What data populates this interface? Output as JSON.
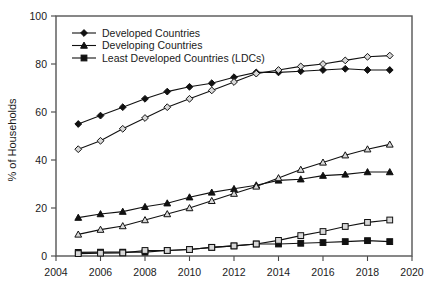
{
  "chart_data": {
    "type": "line",
    "title": "",
    "xlabel": "",
    "ylabel": "% of Households",
    "xlim": [
      2004,
      2020
    ],
    "ylim": [
      0,
      100
    ],
    "xticks": [
      "2004",
      "2006",
      "2008",
      "2010",
      "2012",
      "2014",
      "2016",
      "2018",
      "2020"
    ],
    "yticks": [
      "0",
      "20",
      "40",
      "60",
      "80",
      "100"
    ],
    "grid": false,
    "legend_position": "top-left",
    "x": [
      2005,
      2006,
      2007,
      2008,
      2009,
      2010,
      2011,
      2012,
      2013,
      2014,
      2015,
      2016,
      2017,
      2018,
      2019
    ],
    "series": [
      {
        "name": "Developed Countries",
        "marker": "filled-diamond",
        "in_legend": true,
        "values": [
          55,
          58.5,
          62,
          65.5,
          68.5,
          70.5,
          72,
          74.5,
          76.5,
          76.5,
          77,
          77.5,
          78,
          77.5,
          77.5
        ]
      },
      {
        "name": "Developed Countries",
        "marker": "hollow-diamond",
        "in_legend": false,
        "values": [
          44.5,
          48,
          53,
          57.5,
          62,
          65.5,
          69,
          72.5,
          76,
          77.5,
          79,
          80,
          81.5,
          83,
          83.5
        ]
      },
      {
        "name": "Developing Countries",
        "marker": "filled-triangle",
        "in_legend": true,
        "values": [
          16,
          17.5,
          18.5,
          20.5,
          22,
          24.5,
          26.5,
          28,
          29.5,
          31.5,
          32,
          33.5,
          34,
          35,
          35
        ]
      },
      {
        "name": "Developing Countries",
        "marker": "hollow-triangle",
        "in_legend": false,
        "values": [
          9,
          11,
          12.5,
          15,
          17.5,
          20,
          23,
          26,
          29,
          32.5,
          36,
          39,
          42,
          44.5,
          46.5
        ]
      },
      {
        "name": "Least Developed Countries (LDCs)",
        "marker": "filled-square",
        "in_legend": true,
        "values": [
          1.5,
          1.6,
          1.6,
          1.6,
          2.3,
          2.7,
          3.6,
          4.2,
          5,
          5,
          5.3,
          5.6,
          6,
          6.4,
          6
        ]
      },
      {
        "name": "Least Developed Countries (LDCs)",
        "marker": "hollow-square",
        "in_legend": false,
        "values": [
          1,
          1.2,
          1.3,
          2.3,
          2.3,
          2.7,
          3.6,
          4.2,
          5,
          6.5,
          8.5,
          10.2,
          12.3,
          14,
          15
        ]
      }
    ],
    "legend": [
      {
        "label": "Developed Countries",
        "marker": "filled-diamond"
      },
      {
        "label": "Developing Countries",
        "marker": "filled-triangle"
      },
      {
        "label": "Least Developed Countries (LDCs)",
        "marker": "filled-square"
      }
    ]
  }
}
